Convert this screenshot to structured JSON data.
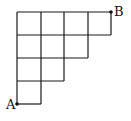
{
  "diagram": {
    "type": "staircase-grid",
    "row_cell_counts": [
      4,
      3,
      2,
      1
    ],
    "line_color": "#1a1a1a",
    "points": {
      "A": {
        "label": "A",
        "position": "bottom-left corner"
      },
      "B": {
        "label": "B",
        "position": "top-right corner"
      }
    }
  }
}
